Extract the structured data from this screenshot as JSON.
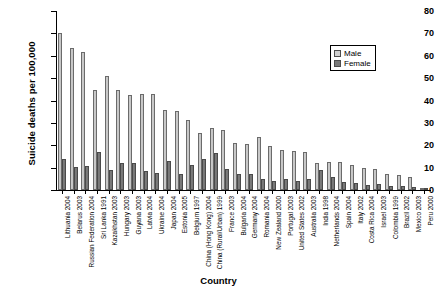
{
  "chart_data": {
    "type": "bar",
    "title": "",
    "xlabel": "Country",
    "ylabel": "Suicide deaths per 100,000",
    "ylim": [
      0,
      80
    ],
    "ytick_step": 10,
    "yticks": [
      0,
      10,
      20,
      30,
      40,
      50,
      60,
      70,
      80
    ],
    "grid": false,
    "legend_position": "top-right",
    "categories": [
      "Lithuania 2004",
      "Belarus 2003",
      "Russian Federation 2004",
      "Sri Lanka 1991",
      "Kazakhstan 2003",
      "Hungary 2003",
      "Guyana 2003",
      "Latvia 2004",
      "Ukraine 2004",
      "Japan 2004",
      "Estonia 2005",
      "Belgium 1997",
      "China (Hong Kong) 2004",
      "China (Rural/Urban) 1999",
      "France 2003",
      "Bulgaria 2004",
      "Germany 2004",
      "Romania 2004",
      "New Zealand 2000",
      "Portugal 2003",
      "United States 2002",
      "Australia 2003",
      "India 1998",
      "Netherlands 2004",
      "Spain 2004",
      "Italy 2002",
      "Costa Rica 2004",
      "Israel 2003",
      "Colombia 1999",
      "Brazil 2002",
      "Mexico 2003",
      "Peru 2000"
    ],
    "series": [
      {
        "name": "Male",
        "color": "#cccccc",
        "values": [
          70.1,
          63.3,
          61.6,
          44.6,
          50.9,
          44.9,
          42.5,
          42.9,
          43.0,
          35.6,
          35.5,
          31.2,
          25.3,
          27.5,
          26.6,
          21.0,
          20.4,
          23.9,
          19.8,
          17.9,
          17.6,
          17.1,
          12.2,
          12.7,
          12.6,
          11.1,
          9.7,
          9.2,
          7.2,
          6.6,
          6.0,
          1.1
        ]
      },
      {
        "name": "Female",
        "color": "#808080",
        "values": [
          14.0,
          10.3,
          10.7,
          16.8,
          9.0,
          12.0,
          12.1,
          8.5,
          7.6,
          12.8,
          7.3,
          11.4,
          13.9,
          16.5,
          9.4,
          7.2,
          7.0,
          4.7,
          4.2,
          4.9,
          4.1,
          4.7,
          9.1,
          5.9,
          3.8,
          3.3,
          2.2,
          2.6,
          2.0,
          1.8,
          1.5,
          0.6
        ]
      }
    ]
  },
  "legend": {
    "items": [
      {
        "label": "Male"
      },
      {
        "label": "Female"
      }
    ]
  }
}
